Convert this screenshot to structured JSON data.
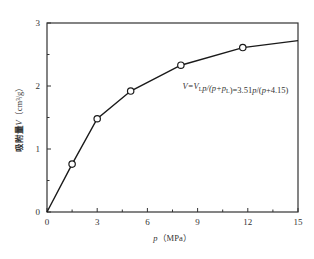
{
  "chart_data": {
    "type": "line",
    "title": "",
    "xlabel": "p（MPa）",
    "ylabel": "吸附量V（cm³/g）",
    "xlim": [
      0,
      15
    ],
    "ylim": [
      0,
      3
    ],
    "xticks": [
      0,
      3,
      6,
      9,
      12,
      15
    ],
    "yticks": [
      0,
      1,
      2,
      3
    ],
    "grid": false,
    "legend": null,
    "series": [
      {
        "name": "measured adsorption",
        "marker": "open-circle",
        "x": [
          0,
          1.5,
          3,
          5,
          8,
          11.7,
          15
        ],
        "y": [
          0,
          0.76,
          1.48,
          1.92,
          2.33,
          2.61,
          2.72
        ],
        "marker_indices": [
          1,
          2,
          3,
          4,
          5
        ]
      }
    ],
    "annotations": [
      {
        "text": "V=VLp/(p+pL)=3.51p/(p+4.15)",
        "x": 8.1,
        "y": 1.95
      }
    ]
  },
  "labels": {
    "x_axis": "p （MPa）",
    "y_axis_cn": "吸附量",
    "y_axis_var": "V",
    "y_axis_unit": "（cm³/g）",
    "equation": "V=VLp/(p+pL)=3.51p/(p+4.15)"
  },
  "colors": {
    "line": "#1a1a1a",
    "axis": "#333333",
    "text": "#333333"
  }
}
